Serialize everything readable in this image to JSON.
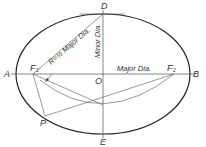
{
  "diagram": {
    "points": {
      "A": "A",
      "B": "B",
      "D": "D",
      "E": "E",
      "O": "O",
      "P": "P",
      "F1": "F",
      "F1_sub": "1",
      "F2": "F",
      "F2_sub": "2"
    },
    "labels": {
      "radius": "R=½ Major Dia.",
      "minor": "Minor Dia.",
      "major": "Major Dia."
    },
    "colors": {
      "ellipse": "#222222",
      "construction": "#555555",
      "text": "#333333"
    }
  }
}
